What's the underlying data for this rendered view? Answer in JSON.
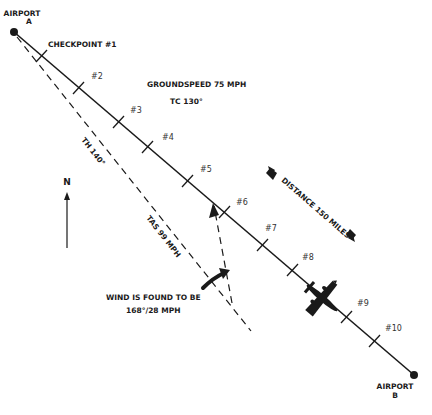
{
  "airport_a": {
    "label_line1": "AIRPORT",
    "label_line2": "A"
  },
  "airport_b": {
    "label_line1": "AIRPORT",
    "label_line2": "B"
  },
  "checkpoints": [
    {
      "label": "CHECKPOINT #1"
    },
    {
      "label": "#2"
    },
    {
      "label": "#3"
    },
    {
      "label": "#4"
    },
    {
      "label": "#5"
    },
    {
      "label": "#6"
    },
    {
      "label": "#7"
    },
    {
      "label": "#8"
    },
    {
      "label": "#9"
    },
    {
      "label": "#10"
    }
  ],
  "groundspeed": "GROUNDSPEED 75 MPH",
  "true_course": "TC 130°",
  "true_heading": "TH 140°",
  "true_airspeed": "TAS 99 MPH",
  "distance": "DISTANCE 150 MILES",
  "wind": {
    "line1": "WIND IS FOUND TO BE",
    "line2": "168°/28 MPH"
  },
  "north": "N",
  "colors": {
    "ink": "#1a1a1a",
    "background": "#ffffff"
  }
}
